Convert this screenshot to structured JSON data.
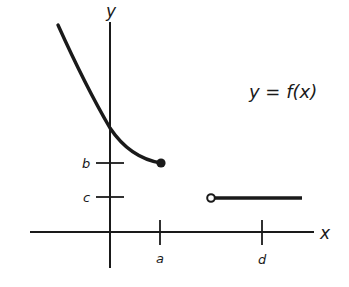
{
  "diagram": {
    "type": "piecewise-function-graph",
    "function_label": "y = f(x)",
    "axes": {
      "x_label": "x",
      "y_label": "y"
    },
    "x_ticks": [
      {
        "label": "a"
      },
      {
        "label": "d"
      }
    ],
    "y_ticks": [
      {
        "label": "b"
      },
      {
        "label": "c"
      }
    ],
    "pieces": [
      {
        "description": "decreasing curve ending at closed point (a, b)",
        "endpoint": "closed"
      },
      {
        "description": "horizontal segment at y = c starting at open point, extending right past d",
        "endpoint": "open"
      }
    ],
    "colors": {
      "stroke": "#1a1a1a",
      "background": "#ffffff"
    }
  }
}
